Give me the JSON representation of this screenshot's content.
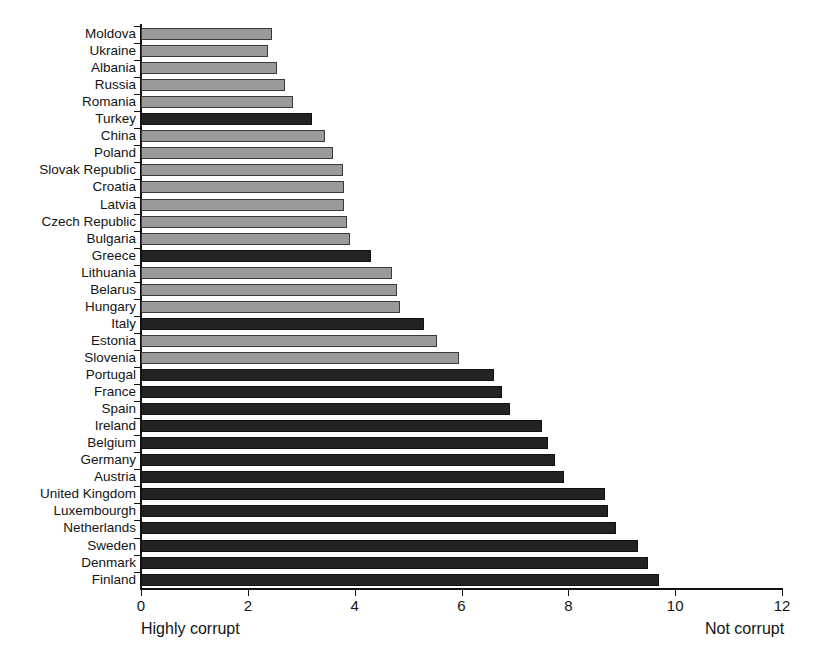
{
  "chart_data": {
    "type": "bar",
    "orientation": "horizontal",
    "title": "",
    "subtitle": "",
    "xlabel": "",
    "ylabel": "",
    "xlim": [
      0,
      12
    ],
    "ylim": null,
    "grid": false,
    "legend": null,
    "legend_position": "none",
    "xticks": [
      0,
      2,
      4,
      6,
      8,
      10,
      12
    ],
    "xtick_labels": [
      "0",
      "2",
      "4",
      "6",
      "8",
      "10",
      "12"
    ],
    "axis_captions": {
      "left": "Highly corrupt",
      "right": "Not corrupt"
    },
    "colors": {
      "light": "#9a9a9a",
      "dark": "#232323",
      "axis": "#111111",
      "text": "#141414",
      "background": "#ffffff"
    },
    "series_groups": [
      {
        "key": "light",
        "color": "#9a9a9a"
      },
      {
        "key": "dark",
        "color": "#232323"
      }
    ],
    "categories": [
      "Moldova",
      "Ukraine",
      "Albania",
      "Russia",
      "Romania",
      "Turkey",
      "China",
      "Poland",
      "Slovak Republic",
      "Croatia",
      "Latvia",
      "Czech Republic",
      "Bulgaria",
      "Greece",
      "Lithuania",
      "Belarus",
      "Hungary",
      "Italy",
      "Estonia",
      "Slovenia",
      "Portugal",
      "France",
      "Spain",
      "Ireland",
      "Belgium",
      "Germany",
      "Austria",
      "United Kingdom",
      "Luxembourgh",
      "Netherlands",
      "Sweden",
      "Denmark",
      "Finland"
    ],
    "values": [
      2.45,
      2.37,
      2.55,
      2.7,
      2.85,
      3.2,
      3.45,
      3.6,
      3.78,
      3.8,
      3.8,
      3.85,
      3.92,
      4.3,
      4.7,
      4.8,
      4.85,
      5.3,
      5.55,
      5.95,
      6.6,
      6.75,
      6.9,
      7.5,
      7.62,
      7.75,
      7.92,
      8.68,
      8.75,
      8.9,
      9.3,
      9.5,
      9.7
    ],
    "bar_styles": [
      "light",
      "light",
      "light",
      "light",
      "light",
      "dark",
      "light",
      "light",
      "light",
      "light",
      "light",
      "light",
      "light",
      "dark",
      "light",
      "light",
      "light",
      "dark",
      "light",
      "light",
      "dark",
      "dark",
      "dark",
      "dark",
      "dark",
      "dark",
      "dark",
      "dark",
      "dark",
      "dark",
      "dark",
      "dark",
      "dark"
    ]
  }
}
